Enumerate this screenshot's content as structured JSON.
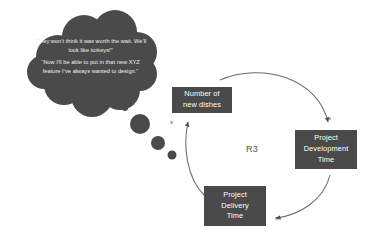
{
  "diagram": {
    "type": "causal-loop-diagram",
    "background_color": "#ffffff",
    "node_fill_color": "#4a4a4a",
    "node_text_color": "#ffffff",
    "link_color": "#6b6b6b",
    "loop_label": "R3",
    "thought_bubble": {
      "fill_color": "#4a4a4a",
      "text_color": "#f2f2f2",
      "lines": [
        "“They won’t think it was worth the wait. We’ll look like turkeys!”",
        "“Now I’ll be able to put in that new XYZ feature I’ve always wanted to design.”"
      ],
      "trail_dot_count": 4
    },
    "nodes": [
      {
        "id": "new-dishes",
        "label": "Number of\nnew dishes",
        "line1": "Number of",
        "line2": "new dishes"
      },
      {
        "id": "dev-time",
        "label": "Project\nDevelopment\nTime",
        "line1": "Project",
        "line2": "Development",
        "line3": "Time"
      },
      {
        "id": "delivery-time",
        "label": "Project\nDelivery\nTime",
        "line1": "Project",
        "line2": "Delivery",
        "line3": "Time"
      }
    ],
    "links": [
      {
        "id": "dishes-to-dev",
        "from": "new-dishes",
        "to": "dev-time",
        "polarity": "s"
      },
      {
        "id": "dev-to-delivery",
        "from": "dev-time",
        "to": "delivery-time",
        "polarity": "s"
      },
      {
        "id": "delivery-to-dishes",
        "from": "delivery-time",
        "to": "new-dishes",
        "polarity": "s"
      }
    ]
  }
}
